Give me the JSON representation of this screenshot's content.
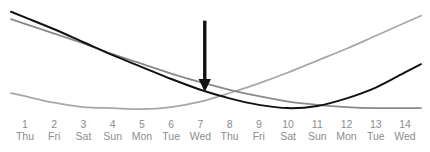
{
  "chart_data": {
    "type": "line",
    "title": "",
    "subtitle": "",
    "xlabel": "",
    "ylabel": "",
    "grid": false,
    "legend": "none",
    "xlim": [
      1,
      14
    ],
    "ylim": [
      0,
      100
    ],
    "x": [
      1,
      2,
      3,
      4,
      5,
      6,
      7,
      8,
      9,
      10,
      11,
      12,
      13,
      14
    ],
    "categories": [
      "1 Thu",
      "2 Fri",
      "3 Sat",
      "4 Sun",
      "5 Mon",
      "6 Tue",
      "7 Wed",
      "8 Thu",
      "9 Fri",
      "10 Sat",
      "11 Sun",
      "12 Mon",
      "13 Tue",
      "14 Wed"
    ],
    "tick_numbers": [
      "1",
      "2",
      "3",
      "4",
      "5",
      "6",
      "7",
      "8",
      "9",
      "10",
      "11",
      "12",
      "13",
      "14"
    ],
    "tick_weekdays": [
      "Thu",
      "Fri",
      "Sat",
      "Sun",
      "Mon",
      "Tue",
      "Wed",
      "Thu",
      "Fri",
      "Sat",
      "Sun",
      "Mon",
      "Tue",
      "Wed"
    ],
    "series": [
      {
        "name": "dark-curve",
        "color": "#111111",
        "width": 2.0,
        "values": [
          95,
          84,
          72,
          60,
          49,
          38,
          28,
          20,
          14,
          11,
          13,
          20,
          30,
          44
        ]
      },
      {
        "name": "medium-gray-curve",
        "color": "#8a8a8a",
        "width": 1.8,
        "values": [
          89,
          80,
          71,
          61,
          52,
          43,
          35,
          28,
          22,
          17,
          14,
          12,
          11,
          11
        ]
      },
      {
        "name": "light-gray-curve",
        "color": "#a8a8a8",
        "width": 1.8,
        "values": [
          22,
          16,
          12,
          11,
          10,
          12,
          17,
          25,
          34,
          44,
          55,
          66,
          78,
          90
        ]
      }
    ],
    "annotations": [
      {
        "name": "down-arrow",
        "type": "arrow",
        "direction": "down",
        "x": 7.15,
        "y_from": 92,
        "y_to": 26,
        "color": "#111111"
      }
    ]
  },
  "axis": {
    "tick_label_color": "#8d8d8d"
  }
}
